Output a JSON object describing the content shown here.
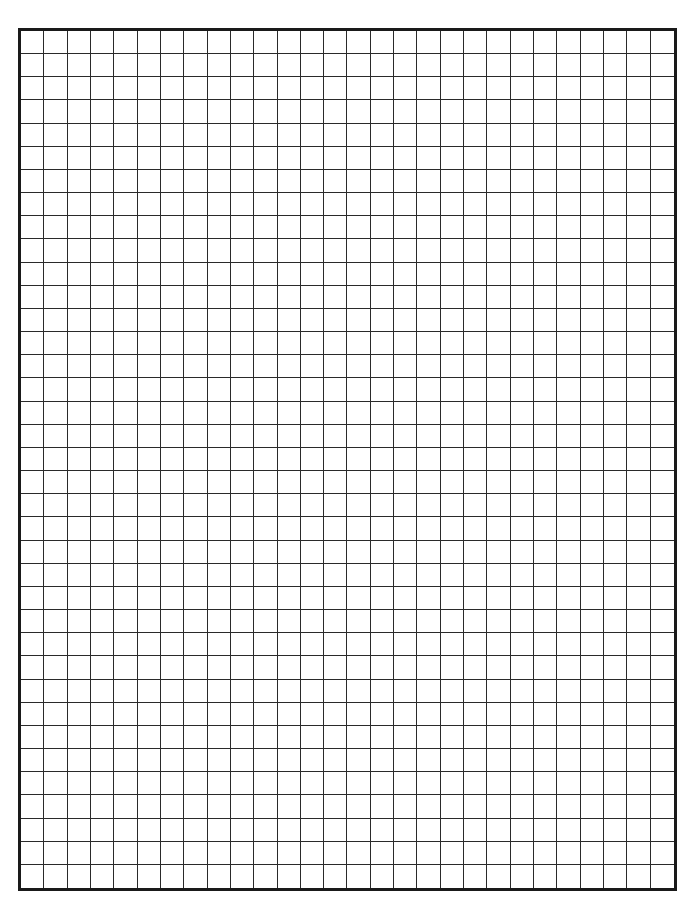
{
  "page": {
    "title_partial": "",
    "grid": {
      "columns": 28,
      "rows": 37
    },
    "colors": {
      "line": "#2a2a2a",
      "border": "#1a1a1a",
      "background": "#ffffff"
    }
  }
}
